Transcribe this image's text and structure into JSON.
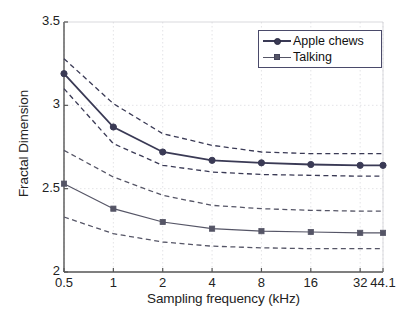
{
  "chart_data": {
    "type": "line",
    "title": "",
    "xlabel": "Sampling frequency (kHz)",
    "ylabel": "Fractal Dimension",
    "x": [
      0.5,
      1,
      2,
      4,
      8,
      16,
      32,
      44.1
    ],
    "xtick_labels": [
      "0.5",
      "1",
      "2",
      "4",
      "8",
      "16",
      "32",
      "44.1"
    ],
    "xscale": "log2",
    "xlim": [
      0.5,
      44.1
    ],
    "ylim": [
      2,
      3.5
    ],
    "ytick_labels": [
      "2",
      "2.5",
      "3",
      "3.5"
    ],
    "ytick_values": [
      2,
      2.5,
      3,
      3.5
    ],
    "grid": true,
    "legend_position": "top-right",
    "series": [
      {
        "name": "Apple chews",
        "marker": "circle",
        "style": "solid",
        "color": "#3a3a55",
        "values": [
          3.19,
          2.87,
          2.72,
          2.67,
          2.655,
          2.645,
          2.64,
          2.64
        ],
        "upper_bound": [
          3.28,
          3.01,
          2.83,
          2.76,
          2.72,
          2.71,
          2.71,
          2.71
        ],
        "lower_bound": [
          3.1,
          2.77,
          2.64,
          2.6,
          2.585,
          2.58,
          2.575,
          2.575
        ]
      },
      {
        "name": "Talking",
        "marker": "square",
        "style": "solid",
        "color": "#555566",
        "values": [
          2.53,
          2.38,
          2.3,
          2.26,
          2.245,
          2.24,
          2.235,
          2.235
        ],
        "upper_bound": [
          2.73,
          2.57,
          2.46,
          2.4,
          2.38,
          2.37,
          2.365,
          2.365
        ],
        "lower_bound": [
          2.33,
          2.23,
          2.18,
          2.155,
          2.145,
          2.14,
          2.14,
          2.14
        ]
      }
    ]
  },
  "legend": {
    "items": [
      {
        "label": "Apple chews"
      },
      {
        "label": "Talking"
      }
    ]
  }
}
